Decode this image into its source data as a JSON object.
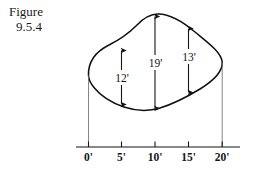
{
  "figure": {
    "caption_line1": "Figure",
    "caption_line2": "9.5.4",
    "shape_name": "irregular-region-outline"
  },
  "axis": {
    "unit_suffix": "'",
    "ticks": [
      {
        "label": "0'",
        "value": 0
      },
      {
        "label": "5'",
        "value": 5
      },
      {
        "label": "10'",
        "value": 10
      },
      {
        "label": "15'",
        "value": 15
      },
      {
        "label": "20'",
        "value": 20
      }
    ]
  },
  "measurements": [
    {
      "label": "12'",
      "value": 12,
      "at": 5
    },
    {
      "label": "19'",
      "value": 19,
      "at": 10
    },
    {
      "label": "13'",
      "value": 13,
      "at": 15
    }
  ],
  "colors": {
    "ink": "#151515",
    "outline": "#101010",
    "thin_rule": "#555555",
    "background": "#ffffff"
  }
}
